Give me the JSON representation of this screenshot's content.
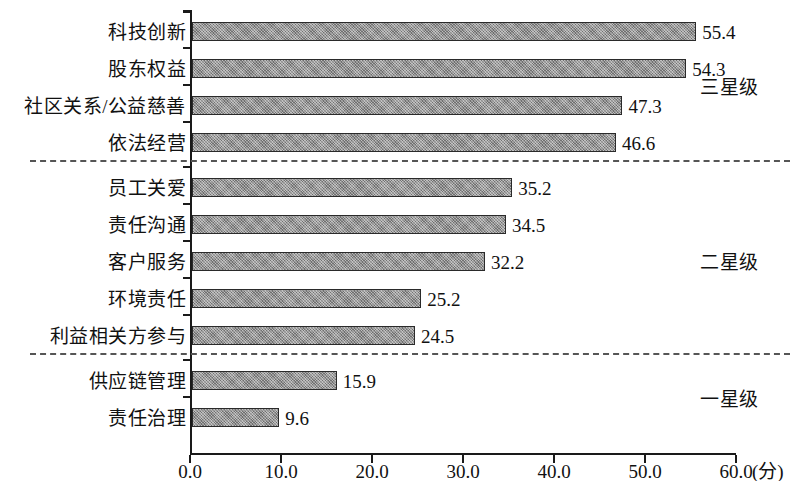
{
  "chart_data": {
    "type": "bar",
    "orientation": "horizontal",
    "title": "",
    "xlabel": "(分)",
    "ylabel": "",
    "xlim": [
      0,
      60
    ],
    "grid": false,
    "legend": null,
    "xticks": [
      "0.0",
      "10.0",
      "20.0",
      "30.0",
      "40.0",
      "50.0",
      "60.0"
    ],
    "xtick_values": [
      0,
      10,
      20,
      30,
      40,
      50,
      60
    ],
    "categories": [
      "科技创新",
      "股东权益",
      "社区关系/公益慈善",
      "依法经营",
      "员工关爱",
      "责任沟通",
      "客户服务",
      "环境责任",
      "利益相关方参与",
      "供应链管理",
      "责任治理"
    ],
    "values": [
      55.4,
      54.3,
      47.3,
      46.6,
      35.2,
      34.5,
      32.2,
      25.2,
      24.5,
      15.9,
      9.6
    ],
    "value_labels": [
      "55.4",
      "54.3",
      "47.3",
      "46.6",
      "35.2",
      "34.5",
      "32.2",
      "25.2",
      "24.5",
      "15.9",
      "9.6"
    ],
    "groups": [
      {
        "label": "三星级",
        "start_index": 0,
        "end_index": 3
      },
      {
        "label": "二星级",
        "start_index": 4,
        "end_index": 8
      },
      {
        "label": "一星级",
        "start_index": 9,
        "end_index": 10
      }
    ],
    "separators_after_index": [
      3,
      8
    ],
    "bar_fill_color": "#8d8d8d",
    "bar_border_color": "#2a2a2a",
    "axis_color": "#1a1a1a",
    "separator_color": "#555555",
    "text_color": "#111111",
    "background_color": "#ffffff"
  }
}
